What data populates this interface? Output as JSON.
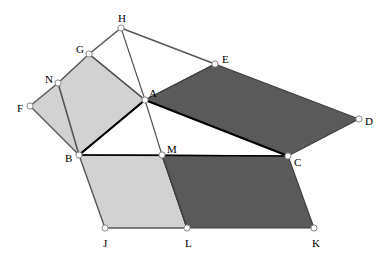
{
  "figure": {
    "width": 390,
    "height": 256,
    "background_color": "#ffffff",
    "colors": {
      "light_fill": "#d2d2d2",
      "dark_fill": "#5a5a5a",
      "white_fill": "#ffffff",
      "edge_gray": "#555555",
      "edge_dark": "#404040",
      "edge_black": "#000000",
      "vertex_fill": "#ffffff",
      "vertex_stroke": "#888888",
      "label_color": "#000000"
    },
    "points": {
      "A": {
        "x": 145,
        "y": 100,
        "label": "A",
        "label_dx": 4,
        "label_dy": -6
      },
      "B": {
        "x": 79,
        "y": 155,
        "label": "B",
        "label_dx": -14,
        "label_dy": 4
      },
      "C": {
        "x": 288,
        "y": 156,
        "label": "C",
        "label_dx": 6,
        "label_dy": 7
      },
      "D": {
        "x": 359,
        "y": 119,
        "label": "D",
        "label_dx": 6,
        "label_dy": 3
      },
      "E": {
        "x": 215,
        "y": 64,
        "label": "E",
        "label_dx": 7,
        "label_dy": -4
      },
      "F": {
        "x": 30,
        "y": 106,
        "label": "F",
        "label_dx": -13,
        "label_dy": 3
      },
      "G": {
        "x": 89,
        "y": 54,
        "label": "G",
        "label_dx": -13,
        "label_dy": -4
      },
      "H": {
        "x": 121,
        "y": 28,
        "label": "H",
        "label_dx": -3,
        "label_dy": -9
      },
      "J": {
        "x": 105,
        "y": 228,
        "label": "J",
        "label_dx": -2,
        "label_dy": 16
      },
      "K": {
        "x": 314,
        "y": 228,
        "label": "K",
        "label_dx": -2,
        "label_dy": 16
      },
      "L": {
        "x": 187,
        "y": 228,
        "label": "L",
        "label_dx": -2,
        "label_dy": 16
      },
      "M": {
        "x": 162,
        "y": 155,
        "label": "M",
        "label_dx": 5,
        "label_dy": -5
      },
      "N": {
        "x": 58,
        "y": 83,
        "label": "N",
        "label_dx": -13,
        "label_dy": -3
      }
    },
    "polygons": [
      {
        "name": "quad-F-N-G-A-B",
        "vertices": [
          "F",
          "N",
          "G",
          "A",
          "B"
        ],
        "fill": "light_fill",
        "stroke": "edge_gray",
        "stroke_width": 1.4
      },
      {
        "name": "parallelogram-A-E-D-C",
        "vertices": [
          "A",
          "E",
          "D",
          "C"
        ],
        "fill": "dark_fill",
        "stroke": "edge_dark",
        "stroke_width": 1.2
      },
      {
        "name": "parallelogram-B-M-L-J",
        "vertices": [
          "B",
          "M",
          "L",
          "J"
        ],
        "fill": "light_fill",
        "stroke": "edge_gray",
        "stroke_width": 1.4
      },
      {
        "name": "parallelogram-M-C-K-L",
        "vertices": [
          "M",
          "C",
          "K",
          "L"
        ],
        "fill": "dark_fill",
        "stroke": "edge_dark",
        "stroke_width": 1.2
      }
    ],
    "segments": [
      {
        "name": "segment-A-B",
        "from": "A",
        "to": "B",
        "stroke": "edge_black",
        "stroke_width": 2.2
      },
      {
        "name": "segment-B-C",
        "from": "B",
        "to": "C",
        "stroke": "edge_black",
        "stroke_width": 1.6
      },
      {
        "name": "segment-A-C",
        "from": "A",
        "to": "C",
        "stroke": "edge_black",
        "stroke_width": 2.2
      },
      {
        "name": "segment-G-H",
        "from": "G",
        "to": "H",
        "stroke": "edge_gray",
        "stroke_width": 1.6
      },
      {
        "name": "segment-H-A",
        "from": "H",
        "to": "A",
        "stroke": "edge_gray",
        "stroke_width": 1.2
      },
      {
        "name": "segment-H-E",
        "from": "H",
        "to": "E",
        "stroke": "edge_gray",
        "stroke_width": 1.4
      },
      {
        "name": "segment-N-B",
        "from": "N",
        "to": "B",
        "stroke": "edge_gray",
        "stroke_width": 1.6
      },
      {
        "name": "segment-A-M",
        "from": "A",
        "to": "M",
        "stroke": "edge_gray",
        "stroke_width": 1.2
      },
      {
        "name": "segment-M-L",
        "from": "M",
        "to": "L",
        "stroke": "edge_dark",
        "stroke_width": 1.4
      },
      {
        "name": "segment-G-A",
        "from": "G",
        "to": "A",
        "stroke": "edge_gray",
        "stroke_width": 1.4
      },
      {
        "name": "segment-A-E",
        "from": "A",
        "to": "E",
        "stroke": "edge_dark",
        "stroke_width": 1.2
      }
    ],
    "vertex_radius": 3.1,
    "vertex_order": [
      "H",
      "G",
      "E",
      "N",
      "F",
      "A",
      "D",
      "B",
      "M",
      "C",
      "J",
      "L",
      "K"
    ]
  }
}
